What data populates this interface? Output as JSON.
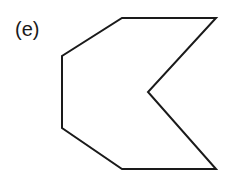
{
  "figure": {
    "label": "(e)",
    "shape": {
      "type": "concave-polygon",
      "points": [
        [
          122,
          18
        ],
        [
          216,
          18
        ],
        [
          148,
          92
        ],
        [
          216,
          169
        ],
        [
          122,
          169
        ],
        [
          62,
          128
        ],
        [
          62,
          56
        ]
      ],
      "stroke": "#1a1a1a",
      "stroke_width": 2,
      "fill": "none"
    }
  }
}
